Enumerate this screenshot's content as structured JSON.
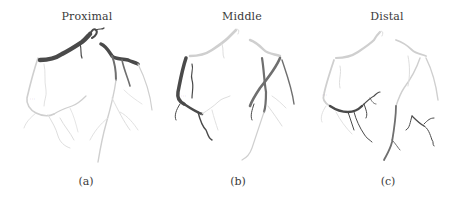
{
  "figure": {
    "panels": [
      {
        "id": "a",
        "title": "Proximal",
        "caption": "(a)",
        "highlighted_segment": "proximal"
      },
      {
        "id": "b",
        "title": "Middle",
        "caption": "(b)",
        "highlighted_segment": "middle"
      },
      {
        "id": "c",
        "title": "Distal",
        "caption": "(c)",
        "highlighted_segment": "distal"
      }
    ],
    "colors": {
      "highlight": "#4a4a4a",
      "highlight_secondary": "#6f6f6f",
      "vessel_unhighlighted": "#cfcfcf",
      "background": "#ffffff"
    }
  }
}
